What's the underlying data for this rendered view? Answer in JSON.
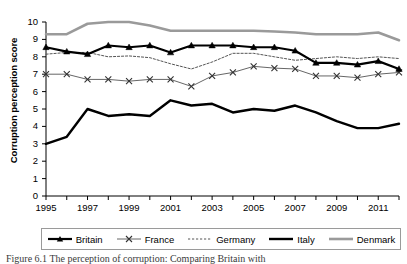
{
  "figure": {
    "caption": "Figure 6.1 The perception of corruption: Comparing Britain with"
  },
  "axes": {
    "ylabel": "Corruption perception score",
    "xlabel": "",
    "yticks": [
      "0",
      "1",
      "2",
      "3",
      "4",
      "5",
      "6",
      "7",
      "8",
      "9",
      "10"
    ],
    "xticks": [
      "1995",
      "1997",
      "1999",
      "2001",
      "2003",
      "2005",
      "2007",
      "2009",
      "2011"
    ]
  },
  "legend": {
    "position": "bottom",
    "items": [
      {
        "label": "Britain",
        "color": "#000000",
        "style": "solid-thick-marker",
        "marker": "triangle"
      },
      {
        "label": "France",
        "color": "#555555",
        "style": "solid-thin-marker",
        "marker": "x"
      },
      {
        "label": "Germany",
        "color": "#555555",
        "style": "dashed-thin",
        "marker": "none"
      },
      {
        "label": "Italy",
        "color": "#000000",
        "style": "solid-thick",
        "marker": "none"
      },
      {
        "label": "Denmark",
        "color": "#9a9a9a",
        "style": "solid-thick",
        "marker": "none"
      }
    ]
  },
  "chart_data": {
    "type": "line",
    "title": "",
    "xlabel": "",
    "ylabel": "Corruption perception score",
    "xlim": [
      1995,
      2012
    ],
    "ylim": [
      0,
      10
    ],
    "grid": false,
    "x": [
      1995,
      1996,
      1997,
      1998,
      1999,
      2000,
      2001,
      2002,
      2003,
      2004,
      2005,
      2006,
      2007,
      2008,
      2009,
      2010,
      2011,
      2012
    ],
    "series": [
      {
        "name": "Britain",
        "color": "#000000",
        "values": [
          8.55,
          8.3,
          8.15,
          8.65,
          8.55,
          8.65,
          8.25,
          8.65,
          8.65,
          8.65,
          8.55,
          8.55,
          8.35,
          7.65,
          7.65,
          7.55,
          7.75,
          7.3
        ]
      },
      {
        "name": "France",
        "color": "#555555",
        "values": [
          7.0,
          7.0,
          6.7,
          6.7,
          6.6,
          6.7,
          6.7,
          6.3,
          6.9,
          7.1,
          7.45,
          7.35,
          7.3,
          6.9,
          6.9,
          6.8,
          7.0,
          7.1
        ]
      },
      {
        "name": "Germany",
        "color": "#555555",
        "values": [
          8.15,
          8.25,
          8.25,
          8.0,
          8.05,
          7.95,
          7.6,
          7.3,
          7.7,
          8.2,
          8.2,
          8.0,
          7.8,
          7.9,
          8.0,
          7.9,
          8.0,
          7.9
        ]
      },
      {
        "name": "Italy",
        "color": "#000000",
        "values": [
          3.0,
          3.4,
          5.0,
          4.6,
          4.7,
          4.6,
          5.5,
          5.2,
          5.3,
          4.8,
          5.0,
          4.9,
          5.2,
          4.8,
          4.3,
          3.9,
          3.9,
          4.15
        ]
      },
      {
        "name": "Denmark",
        "color": "#9a9a9a",
        "values": [
          9.3,
          9.3,
          9.9,
          10.0,
          10.0,
          9.8,
          9.5,
          9.5,
          9.5,
          9.5,
          9.5,
          9.45,
          9.4,
          9.3,
          9.3,
          9.3,
          9.4,
          8.95
        ]
      }
    ]
  }
}
